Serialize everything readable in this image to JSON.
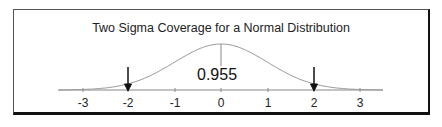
{
  "chart_data": {
    "type": "line",
    "title": "Two Sigma Coverage for a Normal Distribution",
    "xlabel": "",
    "ylabel": "",
    "x_ticks": [
      "-3",
      "-2",
      "-1",
      "0",
      "1",
      "2",
      "3"
    ],
    "xlim": [
      -3.5,
      3.5
    ],
    "series": [
      {
        "name": "Standard normal density",
        "function": "normal_pdf",
        "mean": 0,
        "sd": 1
      }
    ],
    "annotations": [
      {
        "type": "arrow",
        "x": -2,
        "direction": "down"
      },
      {
        "type": "arrow",
        "x": 2,
        "direction": "down"
      },
      {
        "type": "line",
        "x": 0,
        "from": "axis_label",
        "to": "peak"
      },
      {
        "type": "text",
        "text": "0.955",
        "x": 0
      }
    ],
    "grid": false,
    "legend": null
  },
  "title": "Two Sigma Coverage for a Normal Distribution",
  "coverage_label": "0.955",
  "ticks": [
    "-3",
    "-2",
    "-1",
    "0",
    "1",
    "2",
    "3"
  ]
}
